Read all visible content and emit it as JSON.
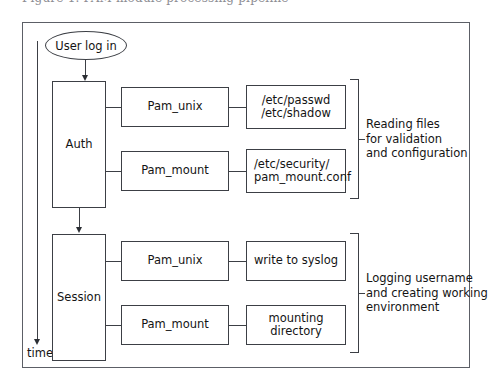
{
  "caption_sliver": "Figure 1.  PAM module processing pipeline",
  "diagram": {
    "timeline": {
      "label": "time",
      "direction": "downward"
    },
    "entry_node": {
      "label": "User log in",
      "shape": "ellipse"
    },
    "stages": [
      {
        "name": "auth",
        "label": "Auth",
        "modules": [
          {
            "name": "pam-unix-auth",
            "label": "Pam_unix",
            "target": {
              "name": "auth-unix-files",
              "lines": [
                "/etc/passwd",
                "/etc/shadow"
              ],
              "align": "center"
            }
          },
          {
            "name": "pam-mount-auth",
            "label": "Pam_mount",
            "target": {
              "name": "auth-mount-files",
              "lines": [
                "/etc/security/",
                "pam_mount.conf"
              ],
              "align": "left"
            }
          }
        ],
        "annotation": {
          "name": "auth-annotation",
          "lines": [
            "Reading files",
            "for validation",
            "and configuration"
          ]
        }
      },
      {
        "name": "session",
        "label": "Session",
        "modules": [
          {
            "name": "pam-unix-session",
            "label": "Pam_unix",
            "target": {
              "name": "session-unix-action",
              "lines": [
                "write to syslog"
              ],
              "align": "center"
            }
          },
          {
            "name": "pam-mount-session",
            "label": "Pam_mount",
            "target": {
              "name": "session-mount-action",
              "lines": [
                "mounting directory"
              ],
              "align": "center"
            }
          }
        ],
        "annotation": {
          "name": "session-annotation",
          "lines": [
            "Logging username",
            "and creating working",
            "environment"
          ]
        }
      }
    ]
  },
  "colors": {
    "stroke": "#3c3f45",
    "frame": "#5c5f66",
    "text": "#141414",
    "background": "#ffffff"
  }
}
